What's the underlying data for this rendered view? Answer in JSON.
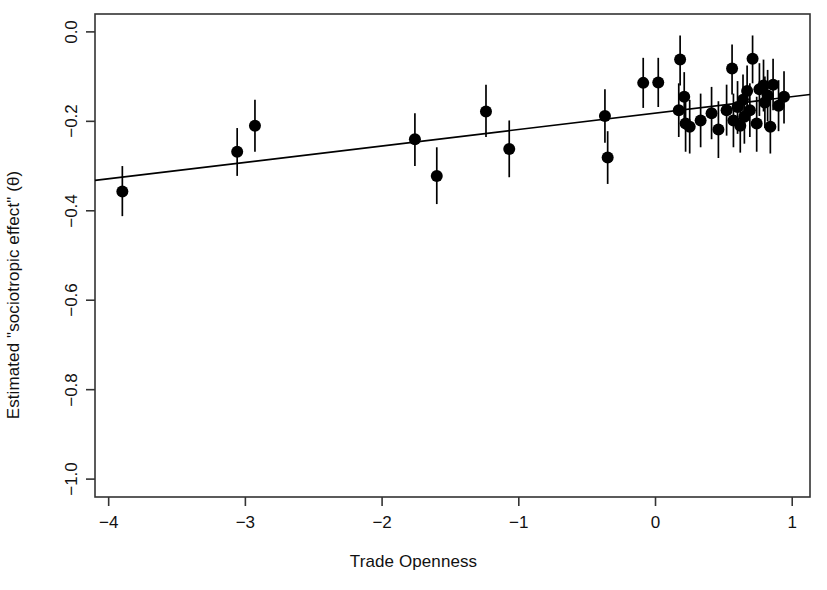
{
  "chart_data": {
    "type": "scatter",
    "title": "",
    "xlabel": "Trade Openness",
    "ylabel": "Estimated \"sociotropic effect\" (θ)",
    "xlim": [
      -4.1,
      1.13
    ],
    "ylim": [
      -1.04,
      0.04
    ],
    "xticks": [
      -4,
      -3,
      -2,
      -1,
      0,
      1
    ],
    "xticklabels": [
      "-4",
      "-3",
      "-2",
      "-1",
      "0",
      "1"
    ],
    "yticks": [
      0.0,
      -0.2,
      -0.4,
      -0.6,
      -0.8,
      -1.0
    ],
    "yticklabels": [
      "0.0",
      "-0.2",
      "-0.4",
      "-0.6",
      "-0.8",
      "-1.0"
    ],
    "grid": false,
    "legend": null,
    "point_color": "#000000",
    "line_color": "#000000",
    "errorbar_color": "#000000",
    "point_radius": 6,
    "fit_line": {
      "type": "linear",
      "x_start": -4.1,
      "y_start": -0.332,
      "x_end": 1.13,
      "y_end": -0.14,
      "slope": 0.0367,
      "intercept": -0.181
    },
    "points": [
      {
        "x": -3.9,
        "y": -0.357,
        "lo": -0.412,
        "hi": -0.3
      },
      {
        "x": -3.06,
        "y": -0.268,
        "lo": -0.322,
        "hi": -0.215
      },
      {
        "x": -2.93,
        "y": -0.21,
        "lo": -0.268,
        "hi": -0.152
      },
      {
        "x": -1.76,
        "y": -0.24,
        "lo": -0.3,
        "hi": -0.182
      },
      {
        "x": -1.6,
        "y": -0.322,
        "lo": -0.385,
        "hi": -0.258
      },
      {
        "x": -1.24,
        "y": -0.178,
        "lo": -0.235,
        "hi": -0.118
      },
      {
        "x": -1.07,
        "y": -0.262,
        "lo": -0.325,
        "hi": -0.198
      },
      {
        "x": -0.37,
        "y": -0.188,
        "lo": -0.248,
        "hi": -0.128
      },
      {
        "x": -0.35,
        "y": -0.281,
        "lo": -0.34,
        "hi": -0.222
      },
      {
        "x": -0.09,
        "y": -0.114,
        "lo": -0.17,
        "hi": -0.058
      },
      {
        "x": 0.02,
        "y": -0.113,
        "lo": -0.168,
        "hi": -0.058
      },
      {
        "x": 0.17,
        "y": -0.175,
        "lo": -0.235,
        "hi": -0.115
      },
      {
        "x": 0.18,
        "y": -0.062,
        "lo": -0.12,
        "hi": -0.008
      },
      {
        "x": 0.21,
        "y": -0.145,
        "lo": -0.2,
        "hi": -0.09
      },
      {
        "x": 0.22,
        "y": -0.205,
        "lo": -0.268,
        "hi": -0.143
      },
      {
        "x": 0.25,
        "y": -0.212,
        "lo": -0.272,
        "hi": -0.152
      },
      {
        "x": 0.33,
        "y": -0.198,
        "lo": -0.258,
        "hi": -0.138
      },
      {
        "x": 0.41,
        "y": -0.182,
        "lo": -0.24,
        "hi": -0.123
      },
      {
        "x": 0.46,
        "y": -0.218,
        "lo": -0.282,
        "hi": -0.155
      },
      {
        "x": 0.52,
        "y": -0.175,
        "lo": -0.232,
        "hi": -0.118
      },
      {
        "x": 0.56,
        "y": -0.082,
        "lo": -0.14,
        "hi": -0.028
      },
      {
        "x": 0.57,
        "y": -0.198,
        "lo": -0.258,
        "hi": -0.138
      },
      {
        "x": 0.6,
        "y": -0.168,
        "lo": -0.228,
        "hi": -0.11
      },
      {
        "x": 0.62,
        "y": -0.21,
        "lo": -0.27,
        "hi": -0.15
      },
      {
        "x": 0.64,
        "y": -0.152,
        "lo": -0.21,
        "hi": -0.095
      },
      {
        "x": 0.65,
        "y": -0.19,
        "lo": -0.25,
        "hi": -0.13
      },
      {
        "x": 0.67,
        "y": -0.132,
        "lo": -0.19,
        "hi": -0.075
      },
      {
        "x": 0.69,
        "y": -0.175,
        "lo": -0.235,
        "hi": -0.115
      },
      {
        "x": 0.71,
        "y": -0.06,
        "lo": -0.115,
        "hi": -0.008
      },
      {
        "x": 0.74,
        "y": -0.205,
        "lo": -0.268,
        "hi": -0.145
      },
      {
        "x": 0.76,
        "y": -0.128,
        "lo": -0.188,
        "hi": -0.07
      },
      {
        "x": 0.79,
        "y": -0.12,
        "lo": -0.178,
        "hi": -0.062
      },
      {
        "x": 0.8,
        "y": -0.158,
        "lo": -0.215,
        "hi": -0.1
      },
      {
        "x": 0.82,
        "y": -0.142,
        "lo": -0.2,
        "hi": -0.085
      },
      {
        "x": 0.84,
        "y": -0.212,
        "lo": -0.272,
        "hi": -0.152
      },
      {
        "x": 0.86,
        "y": -0.118,
        "lo": -0.175,
        "hi": -0.06
      },
      {
        "x": 0.9,
        "y": -0.165,
        "lo": -0.222,
        "hi": -0.108
      },
      {
        "x": 0.94,
        "y": -0.145,
        "lo": -0.205,
        "hi": -0.088
      }
    ]
  }
}
